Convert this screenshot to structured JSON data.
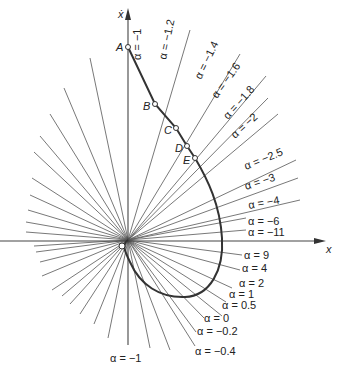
{
  "figure": {
    "type": "phase-plane isocline diagram",
    "axes": {
      "x_label": "x",
      "y_label": "ẋ"
    },
    "origin_label": "O",
    "points": [
      {
        "label": "A"
      },
      {
        "label": "B"
      },
      {
        "label": "C"
      },
      {
        "label": "D"
      },
      {
        "label": "E"
      }
    ],
    "isoclines_upper": [
      {
        "label": "α = −1"
      },
      {
        "label": "α = −1.2"
      },
      {
        "label": "α = −1.4"
      },
      {
        "label": "α = −1.6"
      },
      {
        "label": "α = −1.8"
      },
      {
        "label": "α = −2"
      },
      {
        "label": "α = −2.5"
      },
      {
        "label": "α = −3"
      },
      {
        "label": "α = −4"
      },
      {
        "label": "α = −6"
      },
      {
        "label": "α = −11"
      }
    ],
    "isoclines_lower": [
      {
        "label": "α = 9"
      },
      {
        "label": "α = 4"
      },
      {
        "label": "α = 2"
      },
      {
        "label": "α = 1"
      },
      {
        "label": "α = 0.5"
      },
      {
        "label": "α = 0"
      },
      {
        "label": "α = −0.2"
      },
      {
        "label": "α = −0.4"
      },
      {
        "label": "α = −1"
      }
    ]
  },
  "colors": {
    "line": "#555555",
    "curve": "#333333",
    "background": "#ffffff"
  }
}
